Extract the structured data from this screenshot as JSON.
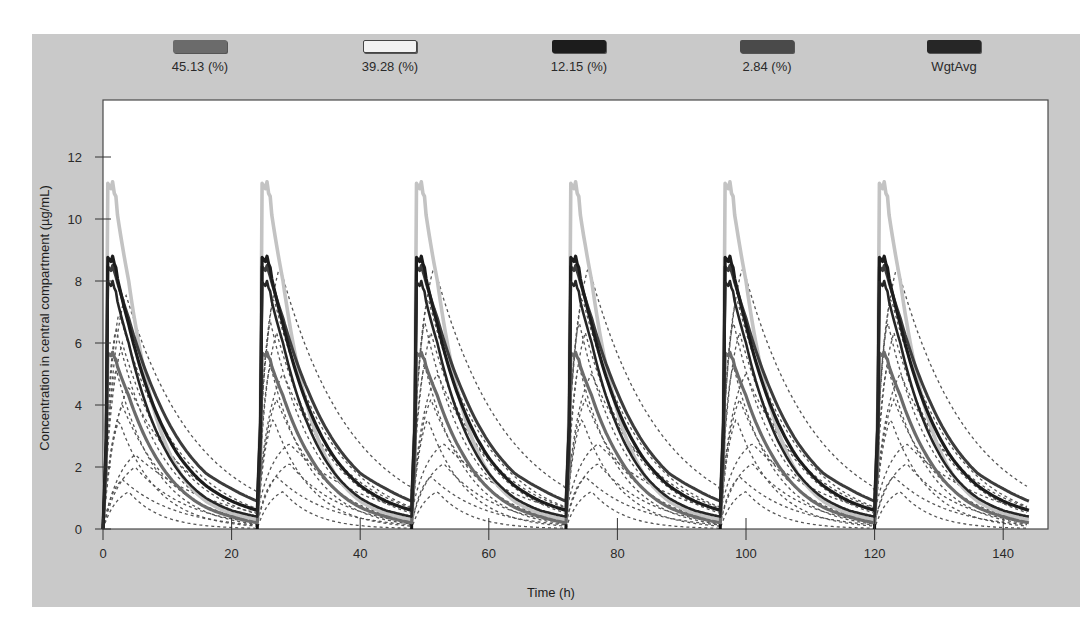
{
  "chart_data": {
    "type": "line",
    "title": "",
    "xlabel": "Time (h)",
    "ylabel": "Concentration in central compartment (µg/mL)",
    "xlim": [
      0,
      147
    ],
    "ylim": [
      0,
      13.8
    ],
    "x_ticks": [
      0,
      20,
      40,
      60,
      80,
      100,
      120,
      140
    ],
    "y_ticks": [
      0,
      2,
      4,
      6,
      8,
      10,
      12
    ],
    "grid": false,
    "legend_position": "top",
    "dosing_interval_h": 24,
    "dose_times_h": [
      0,
      24,
      48,
      72,
      96,
      120
    ],
    "series": [
      {
        "name": "45.13 (%)",
        "label": "45.13 (%)",
        "color": "#6b6b6b",
        "style": "solid",
        "tmax_h": 1.5,
        "cmax": 5.7,
        "ctrough": 0.2,
        "values_per_dose": {
          "t": [
            0,
            1.5,
            4,
            8,
            12,
            16,
            20,
            24
          ],
          "c": [
            0,
            5.7,
            4.3,
            2.4,
            1.3,
            0.7,
            0.4,
            0.2
          ]
        }
      },
      {
        "name": "39.28 (%)",
        "label": "39.28 (%)",
        "color": "#c3c3c3",
        "style": "solid",
        "tmax_h": 1.5,
        "cmax": 11.2,
        "ctrough": 0.3,
        "values_per_dose": {
          "t": [
            0,
            1.5,
            4,
            8,
            12,
            16,
            20,
            24
          ],
          "c": [
            0,
            11.2,
            8.0,
            3.8,
            1.8,
            0.9,
            0.5,
            0.3
          ]
        }
      },
      {
        "name": "12.15 (%)",
        "label": "12.15 (%)",
        "color": "#1c1c1c",
        "style": "solid",
        "tmax_h": 1.5,
        "cmax": 8.8,
        "ctrough": 0.6,
        "values_per_dose": {
          "t": [
            0,
            1.5,
            4,
            8,
            12,
            16,
            20,
            24
          ],
          "c": [
            0,
            8.8,
            6.6,
            3.9,
            2.3,
            1.4,
            0.9,
            0.6
          ]
        }
      },
      {
        "name": "2.84 (%)",
        "label": "2.84 (%)",
        "color": "#3c3c3c",
        "style": "solid",
        "tmax_h": 1.5,
        "cmax": 8.5,
        "ctrough": 0.9,
        "values_per_dose": {
          "t": [
            0,
            1.5,
            4,
            8,
            12,
            16,
            20,
            24
          ],
          "c": [
            0,
            8.5,
            6.8,
            4.4,
            2.8,
            1.8,
            1.3,
            0.9
          ]
        }
      },
      {
        "name": "WgtAvg",
        "label": "WgtAvg",
        "color": "#262626",
        "style": "solid",
        "tmax_h": 1.5,
        "cmax": 8.0,
        "ctrough": 0.4,
        "values_per_dose": {
          "t": [
            0,
            1.5,
            4,
            8,
            12,
            16,
            20,
            24
          ],
          "c": [
            0,
            8.0,
            6.0,
            3.3,
            1.8,
            1.0,
            0.6,
            0.4
          ]
        }
      }
    ],
    "individual_profiles": {
      "style": "dashed",
      "color": "#555555",
      "description": "Individual simulated profiles shown as thin dashed/dotted lines",
      "examples": [
        {
          "cmax": 7.6,
          "tmax_h": 3.5,
          "ke": 0.09
        },
        {
          "cmax": 7.0,
          "tmax_h": 2.5,
          "ke": 0.11
        },
        {
          "cmax": 6.5,
          "tmax_h": 2.0,
          "ke": 0.14
        },
        {
          "cmax": 6.0,
          "tmax_h": 3.0,
          "ke": 0.12
        },
        {
          "cmax": 5.2,
          "tmax_h": 2.0,
          "ke": 0.16
        },
        {
          "cmax": 4.6,
          "tmax_h": 4.0,
          "ke": 0.1
        },
        {
          "cmax": 4.0,
          "tmax_h": 3.0,
          "ke": 0.13
        },
        {
          "cmax": 3.5,
          "tmax_h": 2.5,
          "ke": 0.17
        },
        {
          "cmax": 2.4,
          "tmax_h": 5.0,
          "ke": 0.08
        },
        {
          "cmax": 2.0,
          "tmax_h": 5.0,
          "ke": 0.12
        },
        {
          "cmax": 1.6,
          "tmax_h": 3.0,
          "ke": 0.12
        },
        {
          "cmax": 1.2,
          "tmax_h": 4.0,
          "ke": 0.2
        }
      ]
    }
  },
  "legend": {
    "items": [
      {
        "label": "45.13 (%)",
        "color": "#6b6b6b"
      },
      {
        "label": "39.28 (%)",
        "color": "#f2f2f2"
      },
      {
        "label": "12.15 (%)",
        "color": "#1c1c1c"
      },
      {
        "label": "2.84 (%)",
        "color": "#4a4a4a"
      },
      {
        "label": "WgtAvg",
        "color": "#262626"
      }
    ]
  },
  "axes": {
    "x_title": "Time (h)",
    "y_title": "Concentration in central compartment (µg/mL)",
    "x_tick_labels": [
      "0",
      "20",
      "40",
      "60",
      "80",
      "100",
      "120",
      "140"
    ],
    "y_tick_labels": [
      "0",
      "2",
      "4",
      "6",
      "8",
      "10",
      "12"
    ]
  }
}
